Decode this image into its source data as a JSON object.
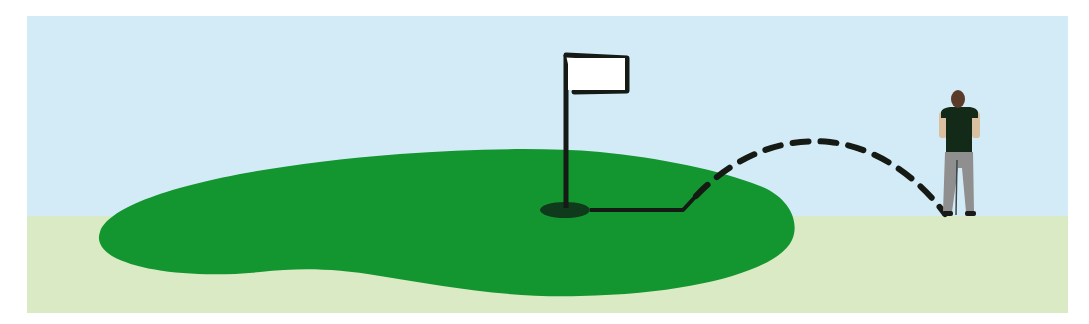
{
  "diagram": {
    "title": "",
    "colors": {
      "background": "#ffffff",
      "sky": "#d3ebf6",
      "fairway": "#d9eac4",
      "green": "#13952f",
      "hole": "#0f3a1c",
      "flag": "#ffffff",
      "line": "#151a15",
      "golfer_shirt": "#142a18",
      "golfer_pants": "#8f8f8f",
      "golfer_skin": "#d8c0a0",
      "golfer_hair": "#5a3a28"
    },
    "elements": [
      {
        "id": "sky",
        "label": "Sky"
      },
      {
        "id": "fairway",
        "label": "Fairway"
      },
      {
        "id": "putting-green",
        "label": "Putting green"
      },
      {
        "id": "hole",
        "label": "Hole"
      },
      {
        "id": "flagstick",
        "label": "Flag"
      },
      {
        "id": "ball-path-chip",
        "label": "Chip shot arc (dashed)"
      },
      {
        "id": "ball-path-roll",
        "label": "Roll path (solid)"
      },
      {
        "id": "golfer",
        "label": "Golfer"
      }
    ]
  }
}
